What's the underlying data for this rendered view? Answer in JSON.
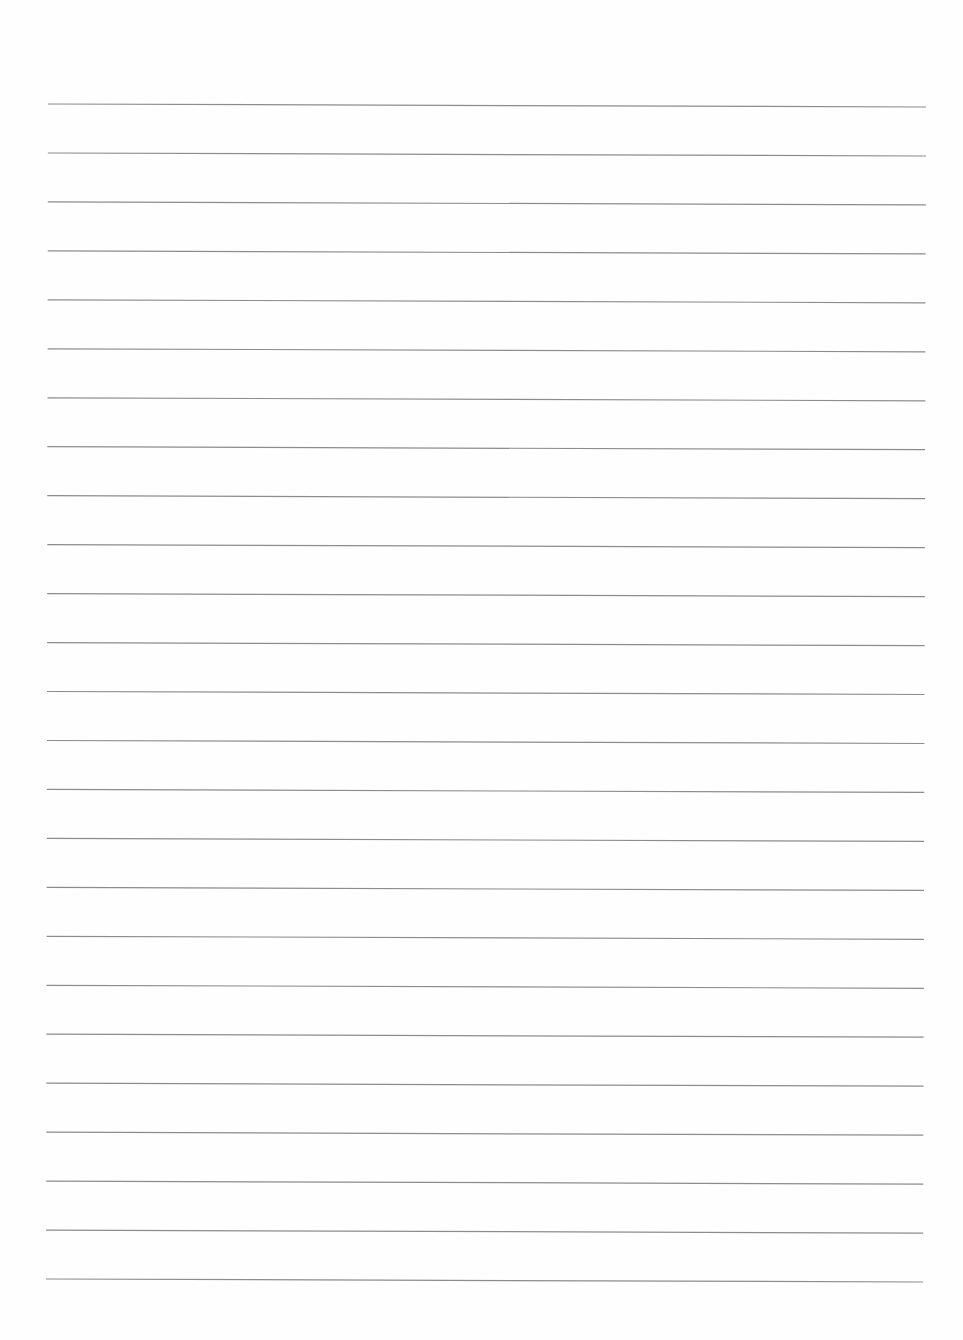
{
  "page": {
    "type": "lined-paper",
    "width": 963,
    "height": 1340,
    "background_color": "#fefefe"
  },
  "ruling": {
    "line_count": 25,
    "line_color": "#8c8c8c",
    "line_width": 1.2,
    "first_line_y": 104,
    "line_spacing": 48.96,
    "left_x_top": 48,
    "left_x_bottom": 46,
    "right_x_top": 926,
    "right_x_bottom": 923,
    "slope_drop_right": 3
  }
}
